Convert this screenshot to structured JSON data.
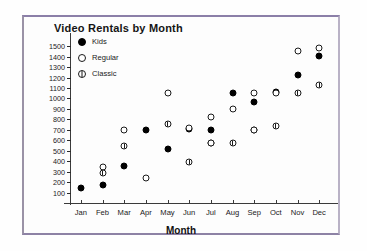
{
  "chart_data": {
    "type": "scatter",
    "title": "Video Rentals by Month",
    "xlabel": "Month",
    "ylabel": "",
    "categories": [
      "Jan",
      "Feb",
      "Mar",
      "Apr",
      "May",
      "Jun",
      "Jul",
      "Aug",
      "Sep",
      "Oct",
      "Nov",
      "Dec"
    ],
    "ylim": [
      0,
      1550
    ],
    "yticks": [
      100,
      200,
      300,
      400,
      500,
      600,
      700,
      800,
      900,
      1000,
      1100,
      1200,
      1300,
      1400,
      1500
    ],
    "ytick_labels": [
      "100",
      "200",
      "300",
      "400",
      "500",
      "600",
      "700",
      "800",
      "900",
      "1000",
      "1100",
      "1200",
      "1300",
      "1400",
      "1500"
    ],
    "grid": false,
    "legend_position": "top-left",
    "series": [
      {
        "name": "Kids",
        "marker": "filled-circle",
        "color": "#000000",
        "values": [
          145,
          175,
          350,
          700,
          520,
          710,
          700,
          1050,
          970,
          1060,
          1220,
          1410
        ]
      },
      {
        "name": "Regular",
        "marker": "open-circle",
        "color": "#ffffff",
        "values": [
          null,
          345,
          700,
          235,
          null,
          null,
          825,
          900,
          1050,
          1050,
          1450,
          1480
        ]
      },
      {
        "name": "Classic",
        "marker": "circle-with-bar",
        "color": "#ffffff",
        "values": [
          null,
          290,
          545,
          null,
          755,
          395,
          570,
          570,
          695,
          740,
          1050,
          1130
        ]
      }
    ],
    "extra_points": [
      {
        "series": "Regular",
        "category": "May",
        "value": 1050
      },
      {
        "series": "Regular",
        "category": "Jun",
        "value": 715
      },
      {
        "series": "Regular",
        "category": "Jul",
        "value": 570
      },
      {
        "series": "Regular",
        "category": "Sep",
        "value": 695
      }
    ]
  },
  "legend": {
    "items": [
      {
        "label": "Kids",
        "marker": "filled-circle"
      },
      {
        "label": "Regular",
        "marker": "open-circle"
      },
      {
        "label": "Classic",
        "marker": "circle-with-bar"
      }
    ]
  },
  "colors": {
    "frame": "#8b7fa8",
    "axis": "#3a3a3a",
    "text": "#1a1a1a",
    "background": "#ffffff"
  }
}
